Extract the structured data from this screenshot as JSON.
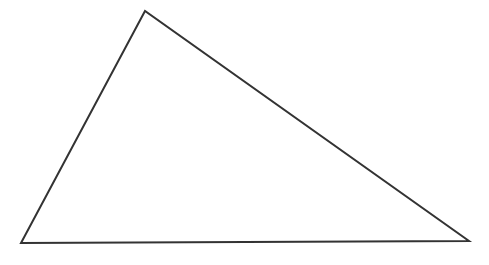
{
  "diagram": {
    "shape": "triangle",
    "background": "#ffffff",
    "stroke_color": "#333333",
    "stroke_width": 2,
    "fill": "none",
    "vertices": [
      {
        "name": "top",
        "x": 145,
        "y": 11
      },
      {
        "name": "bottom-left",
        "x": 21,
        "y": 243
      },
      {
        "name": "bottom-right",
        "x": 469,
        "y": 241
      }
    ]
  }
}
